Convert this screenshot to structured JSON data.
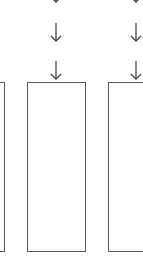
{
  "diagram": {
    "type": "flow",
    "columns": [
      {
        "id": "left",
        "box": {
          "label": ""
        },
        "arrows": 0
      },
      {
        "id": "middle",
        "box": {
          "label": ""
        },
        "arrows": 3
      },
      {
        "id": "right",
        "box": {
          "label": ""
        },
        "arrows": 3
      }
    ],
    "stroke_color": "#5a5a5a",
    "arrow_glyph": "down-arrow-icon"
  }
}
